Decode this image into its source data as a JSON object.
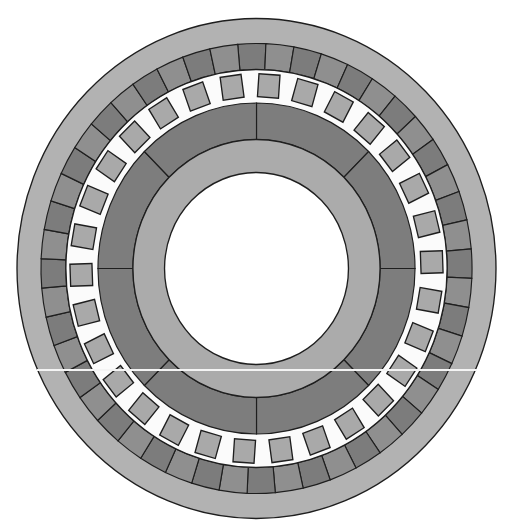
{
  "diagram": {
    "type": "machine-cross-section",
    "canvas": {
      "width": 521,
      "height": 532,
      "background": "#ffffff"
    },
    "center": {
      "x": 256.5,
      "y": 268.5
    },
    "x_scale": 0.958,
    "outline_color": "#1e1e1e",
    "rings": {
      "outer_housing": {
        "r_outer": 250,
        "r_inner": 225,
        "fill": "#b2b2b2"
      },
      "stator_segments": {
        "r_outer": 225,
        "r_inner": 199,
        "count": 48,
        "start_angle_deg": -5,
        "fills": [
          "#7c7c7c",
          "#8f8f8f"
        ]
      },
      "air_gap": {
        "r_outer": 199,
        "r_inner": 165.5,
        "fill": "#fbfbfb"
      },
      "slots": {
        "count": 30,
        "center_radius": 183,
        "width": 22,
        "height": 23,
        "start_angle_deg": 4,
        "fill": "#a9a9a9"
      },
      "rotor_segments": {
        "r_outer": 165.5,
        "r_inner": 129,
        "count": 8,
        "start_angle_deg": 0,
        "fills": [
          "#7d7d7d",
          "#7d7d7d"
        ]
      },
      "inner_ring": {
        "r_outer": 129,
        "r_inner": 96,
        "fill": "#ababab"
      },
      "bore": {
        "r": 96,
        "fill": "#ffffff"
      }
    },
    "artifact_line": {
      "x1": 37,
      "x2": 477,
      "y": 370,
      "color": "#f4f4f4"
    }
  }
}
